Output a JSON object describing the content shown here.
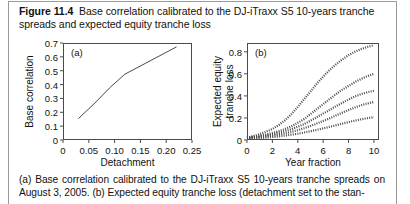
{
  "figure": {
    "label": "Figure 11.4",
    "title": "Base correlation calibrated to the DJ-iTraxx S5 10-years tranche spreads and expected equity tranche loss",
    "caption": "(a) Base correlation calibrated to the DJ-iTraxx S5 10-years tranche spreads on August 3, 2005. (b) Expected equity tranche loss (detachment set to the stan-",
    "page_border_color": "#9a9a9a",
    "axis_color": "#4a4a4a",
    "curve_color": "#4a4a4a"
  },
  "chart_data": [
    {
      "type": "line",
      "panel": "(a)",
      "title": "",
      "xlabel": "Detachment",
      "ylabel": "Base correlation",
      "xlim": [
        0,
        0.25
      ],
      "ylim": [
        0,
        0.7
      ],
      "xticks": [
        0,
        0.05,
        0.1,
        0.15,
        0.2,
        0.25
      ],
      "xticklabels": [
        "0",
        "0.05",
        "0.10",
        "0.15",
        "0.20",
        "0.25"
      ],
      "yticks": [
        0,
        0.1,
        0.2,
        0.3,
        0.4,
        0.5,
        0.6,
        0.7
      ],
      "yticklabels": [
        "0",
        "0.1",
        "0.2",
        "0.3",
        "0.4",
        "0.5",
        "0.6",
        "0.7"
      ],
      "grid": false,
      "legend": "none",
      "series": [
        {
          "name": "base correlation",
          "style": "solid",
          "x": [
            0.03,
            0.06,
            0.09,
            0.12,
            0.22
          ],
          "y": [
            0.155,
            0.26,
            0.375,
            0.475,
            0.672
          ]
        }
      ]
    },
    {
      "type": "line",
      "panel": "(b)",
      "title": "",
      "xlabel": "Year fraction",
      "ylabel": "Expected equity tranche loss",
      "xlim": [
        0,
        10.4
      ],
      "ylim": [
        0,
        0.88
      ],
      "xticks": [
        0,
        2,
        4,
        6,
        8,
        10
      ],
      "xticklabels": [
        "0",
        "2",
        "4",
        "6",
        "8",
        "10"
      ],
      "yticks": [
        0,
        0.2,
        0.4,
        0.6,
        0.8
      ],
      "yticklabels": [
        "0",
        "0.2",
        "0.4",
        "0.6",
        "0.8"
      ],
      "grid": false,
      "legend": "none",
      "series": [
        {
          "name": "curve-1",
          "style": "dotted",
          "x": [
            0,
            0.5,
            1,
            1.5,
            2,
            2.5,
            3,
            3.5,
            4,
            4.5,
            5,
            5.5,
            6,
            6.5,
            7,
            7.5,
            8,
            8.5,
            9,
            9.5,
            10
          ],
          "y": [
            0.02,
            0.035,
            0.055,
            0.075,
            0.1,
            0.135,
            0.18,
            0.235,
            0.3,
            0.37,
            0.44,
            0.51,
            0.575,
            0.635,
            0.685,
            0.73,
            0.77,
            0.8,
            0.825,
            0.845,
            0.86
          ]
        },
        {
          "name": "curve-2",
          "style": "dotted",
          "x": [
            0,
            0.5,
            1,
            1.5,
            2,
            2.5,
            3,
            3.5,
            4,
            4.5,
            5,
            5.5,
            6,
            6.5,
            7,
            7.5,
            8,
            8.5,
            9,
            9.5,
            10
          ],
          "y": [
            0.022,
            0.03,
            0.04,
            0.05,
            0.063,
            0.08,
            0.1,
            0.125,
            0.155,
            0.19,
            0.235,
            0.28,
            0.325,
            0.37,
            0.415,
            0.455,
            0.49,
            0.525,
            0.555,
            0.58,
            0.6
          ]
        },
        {
          "name": "curve-3",
          "style": "dotted",
          "x": [
            0,
            0.5,
            1,
            1.5,
            2,
            2.5,
            3,
            3.5,
            4,
            4.5,
            5,
            5.5,
            6,
            6.5,
            7,
            7.5,
            8,
            8.5,
            9,
            9.5,
            10
          ],
          "y": [
            0.02,
            0.026,
            0.033,
            0.042,
            0.052,
            0.065,
            0.08,
            0.098,
            0.12,
            0.145,
            0.175,
            0.207,
            0.24,
            0.272,
            0.305,
            0.337,
            0.367,
            0.395,
            0.417,
            0.434,
            0.447
          ]
        },
        {
          "name": "curve-4",
          "style": "dotted",
          "x": [
            0,
            0.5,
            1,
            1.5,
            2,
            2.5,
            3,
            3.5,
            4,
            4.5,
            5,
            5.5,
            6,
            6.5,
            7,
            7.5,
            8,
            8.5,
            9,
            9.5,
            10
          ],
          "y": [
            0.018,
            0.022,
            0.027,
            0.033,
            0.04,
            0.049,
            0.06,
            0.073,
            0.089,
            0.107,
            0.127,
            0.149,
            0.172,
            0.196,
            0.222,
            0.247,
            0.272,
            0.295,
            0.315,
            0.332,
            0.345
          ]
        },
        {
          "name": "curve-5",
          "style": "dotted",
          "x": [
            0,
            0.5,
            1,
            1.5,
            2,
            2.5,
            3,
            3.5,
            4,
            4.5,
            5,
            5.5,
            6,
            6.5,
            7,
            7.5,
            8,
            8.5,
            9,
            9.5,
            10
          ],
          "y": [
            0.012,
            0.015,
            0.018,
            0.022,
            0.027,
            0.033,
            0.04,
            0.048,
            0.057,
            0.068,
            0.08,
            0.092,
            0.105,
            0.119,
            0.133,
            0.148,
            0.162,
            0.176,
            0.188,
            0.198,
            0.207
          ]
        }
      ]
    }
  ]
}
